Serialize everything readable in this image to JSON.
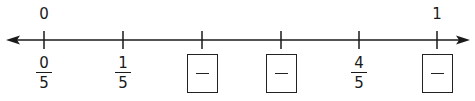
{
  "number_line": {
    "direction_arrows": [
      "left",
      "right"
    ],
    "line_color": "#1a1a1a",
    "top_labels": [
      {
        "tick_index": 0,
        "text": "0"
      },
      {
        "tick_index": 5,
        "text": "1"
      }
    ],
    "ticks": [
      {
        "x": 44,
        "type": "fraction",
        "numerator": "0",
        "denominator": "5"
      },
      {
        "x": 123,
        "type": "fraction",
        "numerator": "1",
        "denominator": "5"
      },
      {
        "x": 202,
        "type": "blank_box",
        "placeholder": "—"
      },
      {
        "x": 281,
        "type": "blank_box",
        "placeholder": "—"
      },
      {
        "x": 359,
        "type": "fraction",
        "numerator": "4",
        "denominator": "5"
      },
      {
        "x": 437,
        "type": "blank_box",
        "placeholder": "—"
      }
    ]
  }
}
